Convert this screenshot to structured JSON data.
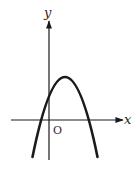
{
  "diagram": {
    "type": "function-graph",
    "axes": {
      "x_label": "x",
      "y_label": "y",
      "origin_label": "O"
    },
    "curve": {
      "kind": "parabola",
      "opens": "down",
      "vertex_px": [
        65,
        77
      ],
      "x_intercepts_px": [
        38,
        90
      ],
      "y_intercept_px": 95
    },
    "colors": {
      "stroke": "#1a1a1a",
      "background": "#ffffff"
    }
  }
}
